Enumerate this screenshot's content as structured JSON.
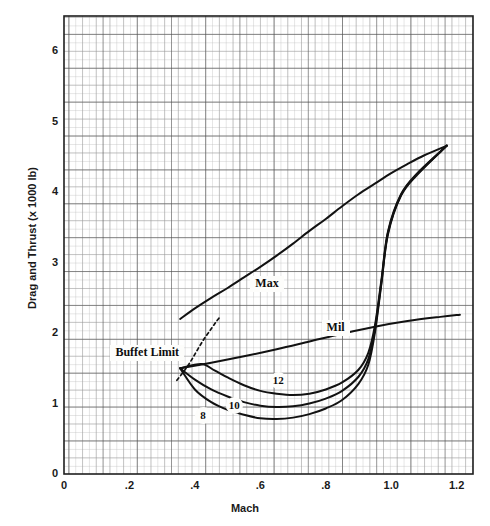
{
  "chart_data": {
    "type": "line",
    "title": "",
    "xlabel": "Mach",
    "ylabel": "Drag and Thrust (x 1000 lb)",
    "xlim": [
      0,
      1.25
    ],
    "ylim": [
      0,
      6.5
    ],
    "xticks": [
      "0",
      ".2",
      ".4",
      ".6",
      ".8",
      "1.0",
      "1.2"
    ],
    "xtick_values": [
      0,
      0.2,
      0.4,
      0.6,
      0.8,
      1.0,
      1.2
    ],
    "yticks": [
      "0",
      "1",
      "2",
      "3",
      "4",
      "5",
      "6"
    ],
    "ytick_values": [
      0,
      1,
      2,
      3,
      4,
      5,
      6
    ],
    "grid": "graph-paper fine grid, major lines every 0.05 Mach and 0.25 units",
    "legend_position": "inline curve labels",
    "series": [
      {
        "name": "Max",
        "label": "Max",
        "kind": "thrust",
        "points": [
          [
            0.355,
            2.2
          ],
          [
            0.4,
            2.35
          ],
          [
            0.45,
            2.5
          ],
          [
            0.5,
            2.64
          ],
          [
            0.55,
            2.79
          ],
          [
            0.6,
            2.94
          ],
          [
            0.65,
            3.1
          ],
          [
            0.7,
            3.27
          ],
          [
            0.75,
            3.45
          ],
          [
            0.8,
            3.62
          ],
          [
            0.85,
            3.8
          ],
          [
            0.9,
            3.97
          ],
          [
            0.95,
            4.12
          ],
          [
            1.0,
            4.27
          ],
          [
            1.05,
            4.4
          ],
          [
            1.1,
            4.52
          ],
          [
            1.17,
            4.66
          ]
        ]
      },
      {
        "name": "Mil",
        "label": "Mil",
        "kind": "thrust",
        "points": [
          [
            0.355,
            1.5
          ],
          [
            0.45,
            1.58
          ],
          [
            0.55,
            1.67
          ],
          [
            0.65,
            1.77
          ],
          [
            0.75,
            1.88
          ],
          [
            0.85,
            1.99
          ],
          [
            0.95,
            2.09
          ],
          [
            1.05,
            2.17
          ],
          [
            1.15,
            2.23
          ],
          [
            1.21,
            2.26
          ]
        ]
      },
      {
        "name": "8",
        "label": "8",
        "kind": "drag",
        "points": [
          [
            0.355,
            1.5
          ],
          [
            0.4,
            1.2
          ],
          [
            0.45,
            1.02
          ],
          [
            0.5,
            0.91
          ],
          [
            0.55,
            0.84
          ],
          [
            0.6,
            0.79
          ],
          [
            0.65,
            0.78
          ],
          [
            0.7,
            0.8
          ],
          [
            0.75,
            0.85
          ],
          [
            0.8,
            0.93
          ],
          [
            0.85,
            1.05
          ],
          [
            0.9,
            1.28
          ],
          [
            0.93,
            1.55
          ],
          [
            0.95,
            2.0
          ],
          [
            0.97,
            2.7
          ],
          [
            0.99,
            3.4
          ],
          [
            1.03,
            3.95
          ],
          [
            1.08,
            4.25
          ],
          [
            1.17,
            4.66
          ]
        ]
      },
      {
        "name": "10",
        "label": "10",
        "kind": "drag",
        "points": [
          [
            0.355,
            1.5
          ],
          [
            0.4,
            1.34
          ],
          [
            0.45,
            1.2
          ],
          [
            0.5,
            1.1
          ],
          [
            0.55,
            1.02
          ],
          [
            0.6,
            0.97
          ],
          [
            0.65,
            0.95
          ],
          [
            0.7,
            0.96
          ],
          [
            0.75,
            1.0
          ],
          [
            0.8,
            1.07
          ],
          [
            0.85,
            1.18
          ],
          [
            0.9,
            1.38
          ],
          [
            0.93,
            1.63
          ],
          [
            0.95,
            2.05
          ],
          [
            0.97,
            2.72
          ],
          [
            0.99,
            3.42
          ],
          [
            1.03,
            3.96
          ],
          [
            1.08,
            4.26
          ],
          [
            1.17,
            4.66
          ]
        ]
      },
      {
        "name": "12",
        "label": "12",
        "kind": "drag",
        "points": [
          [
            0.355,
            1.5
          ],
          [
            0.42,
            1.56
          ],
          [
            0.46,
            1.47
          ],
          [
            0.5,
            1.37
          ],
          [
            0.55,
            1.26
          ],
          [
            0.6,
            1.18
          ],
          [
            0.65,
            1.14
          ],
          [
            0.7,
            1.12
          ],
          [
            0.75,
            1.14
          ],
          [
            0.8,
            1.2
          ],
          [
            0.85,
            1.3
          ],
          [
            0.9,
            1.48
          ],
          [
            0.93,
            1.72
          ],
          [
            0.95,
            2.1
          ],
          [
            0.97,
            2.75
          ],
          [
            0.99,
            3.44
          ],
          [
            1.03,
            3.97
          ],
          [
            1.08,
            4.27
          ],
          [
            1.17,
            4.66
          ]
        ]
      },
      {
        "name": "Buffet Limit",
        "label": "Buffet Limit",
        "kind": "buffet",
        "style": "dashed",
        "points": [
          [
            0.345,
            1.33
          ],
          [
            0.37,
            1.48
          ],
          [
            0.39,
            1.62
          ],
          [
            0.41,
            1.78
          ],
          [
            0.43,
            1.93
          ],
          [
            0.45,
            2.06
          ],
          [
            0.465,
            2.16
          ],
          [
            0.475,
            2.22
          ]
        ]
      }
    ],
    "annotations": [
      {
        "text": "Max",
        "x": 0.62,
        "y": 2.7
      },
      {
        "text": "Mil",
        "x": 0.83,
        "y": 2.07
      },
      {
        "text": "Buffet Limit",
        "x": 0.255,
        "y": 1.72
      },
      {
        "text": "8",
        "x": 0.425,
        "y": 0.83
      },
      {
        "text": "10",
        "x": 0.52,
        "y": 0.97
      },
      {
        "text": "12",
        "x": 0.655,
        "y": 1.32
      }
    ]
  }
}
